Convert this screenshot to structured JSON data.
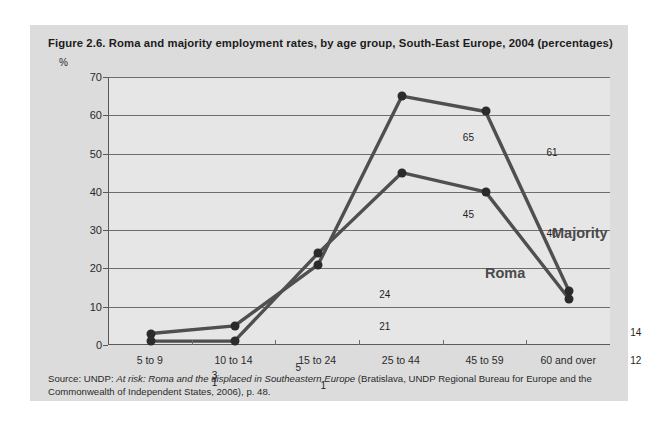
{
  "figure": {
    "title": "Figure 2.6.  Roma and majority employment rates, by age group, South-East Europe, 2004 (percentages)",
    "unit_label": "%",
    "source_prefix": "Source: UNDP: ",
    "source_italic": "At risk: Roma and the displaced in Southeastern Europe",
    "source_suffix": " (Bratislava, UNDP Regional Bureau for Europe and the Commonwealth of Independent States, 2006), p. 48."
  },
  "colors": {
    "panel_background": "#dcdcdc",
    "plot_background": "#e6e6e6",
    "line": "#4f4f4f",
    "marker": "#2b2b2b",
    "gridline": "#6e6e6e",
    "axis": "#5a5a5a",
    "series_label": "#4a4a4a",
    "text": "#1c1c1c"
  },
  "chart_data": {
    "type": "line",
    "title": "Figure 2.6.  Roma and majority employment rates, by age group, South-East Europe, 2004 (percentages)",
    "xlabel": "",
    "ylabel": "%",
    "ylim": [
      0,
      70
    ],
    "yticks": [
      0,
      10,
      20,
      30,
      40,
      50,
      60,
      70
    ],
    "grid": true,
    "legend_position": "inline-annotation",
    "categories": [
      "5 to 9",
      "10 to 14",
      "15 to 24",
      "25 to 44",
      "45 to 59",
      "60 and over"
    ],
    "series": [
      {
        "name": "Majority",
        "values": [
          3,
          5,
          21,
          65,
          61,
          14
        ],
        "label_positions": [
          "above",
          "above",
          "below",
          "above",
          "above",
          "above"
        ]
      },
      {
        "name": "Roma",
        "values": [
          1,
          1,
          24,
          45,
          40,
          12
        ],
        "label_positions": [
          "above",
          "right",
          "above",
          "above",
          "above",
          "below"
        ]
      }
    ]
  }
}
